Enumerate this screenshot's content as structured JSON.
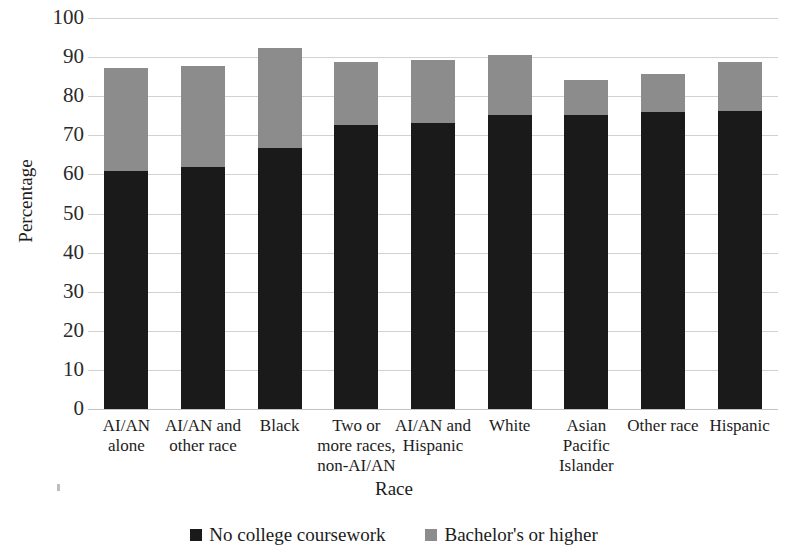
{
  "chart_data": {
    "type": "bar",
    "subtype": "stacked-column",
    "title": "",
    "xlabel": "Race",
    "ylabel": "Percentage",
    "ylim": [
      0,
      100
    ],
    "ytick_step": 10,
    "yticks": [
      100,
      90,
      80,
      70,
      60,
      50,
      40,
      30,
      20,
      10,
      0
    ],
    "grid": true,
    "legend_position": "bottom",
    "categories": [
      "AI/AN alone",
      "AI/AN and other race",
      "Black",
      "Two or more races, non-AI/AN",
      "AI/AN and Hispanic",
      "White",
      "Asian Pacific Islander",
      "Other race",
      "Hispanic"
    ],
    "category_lines": [
      [
        "AI/AN",
        "alone"
      ],
      [
        "AI/AN and",
        "other race"
      ],
      [
        "Black"
      ],
      [
        "Two or",
        "more races,",
        "non-AI/AN"
      ],
      [
        "AI/AN and",
        "Hispanic"
      ],
      [
        "White"
      ],
      [
        "Asian",
        "Pacific",
        "Islander"
      ],
      [
        "Other race"
      ],
      [
        "Hispanic"
      ]
    ],
    "series": [
      {
        "name": "No college coursework",
        "color": "#1a1a1a",
        "values": [
          61.0,
          61.8,
          66.8,
          72.7,
          73.2,
          75.2,
          75.2,
          76.0,
          76.2
        ]
      },
      {
        "name": "Bachelor's or higher",
        "color": "#8c8c8c",
        "values": [
          26.2,
          25.9,
          25.5,
          16.0,
          16.1,
          15.3,
          9.0,
          9.6,
          12.6
        ]
      }
    ],
    "totals": [
      87.2,
      87.7,
      92.3,
      88.7,
      89.3,
      90.5,
      84.2,
      85.6,
      88.8
    ]
  },
  "legend": {
    "items": [
      {
        "label": "No college coursework",
        "color": "#1a1a1a"
      },
      {
        "label": "Bachelor's or higher",
        "color": "#8c8c8c"
      }
    ]
  },
  "axes": {
    "y_title": "Percentage",
    "x_title": "Race"
  },
  "colors": {
    "series_dark": "#1a1a1a",
    "series_gray": "#8c8c8c",
    "gridline": "#d2d2d2",
    "text": "#1c1c1c",
    "background": "#ffffff"
  }
}
